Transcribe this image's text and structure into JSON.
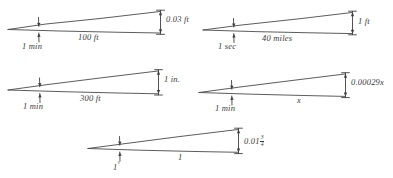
{
  "figure": {
    "background_color": "#ffffff",
    "ink_color": "#3f3f3d",
    "triangles": [
      {
        "id": "top-left",
        "angle_label": "1 min",
        "base_label": "100 ft",
        "rise_label": "0.03 ft"
      },
      {
        "id": "top-right",
        "angle_label": "1 sec",
        "base_label": "40 miles",
        "rise_label": "1 ft"
      },
      {
        "id": "middle-left",
        "angle_label": "1 min",
        "base_label": "300 ft",
        "rise_label": "1 in."
      },
      {
        "id": "middle-right",
        "angle_label": "1 min",
        "base_label": "x",
        "rise_label": "0.00029x"
      },
      {
        "id": "bottom-center",
        "angle_label": "1",
        "angle_label_degree_symbol": "°",
        "base_label": "1",
        "rise_label_whole": "0.01",
        "rise_fraction_numerator": "3",
        "rise_fraction_denominator": "4"
      }
    ]
  }
}
